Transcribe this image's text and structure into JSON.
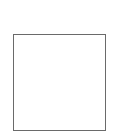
{
  "canvas": {
    "background": "#ffffff"
  },
  "box": {
    "border_color": "#6a6a6a",
    "fill": "#ffffff",
    "content": ""
  }
}
